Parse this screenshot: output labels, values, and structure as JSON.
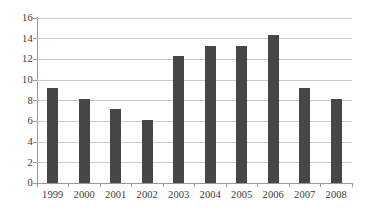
{
  "chart_data": {
    "type": "bar",
    "title": "",
    "subtitle": "",
    "xlabel": "",
    "ylabel": "",
    "categories": [
      "1999",
      "2000",
      "2001",
      "2002",
      "2003",
      "2004",
      "2005",
      "2006",
      "2007",
      "2008"
    ],
    "values": [
      9,
      8,
      7,
      6,
      12,
      13,
      13,
      14,
      9,
      8
    ],
    "series": [
      {
        "name": "",
        "values": [
          9,
          8,
          7,
          6,
          12,
          13,
          13,
          14,
          9,
          8
        ]
      }
    ],
    "ylim": [
      0,
      16
    ],
    "y_ticks": [
      0,
      2,
      4,
      6,
      8,
      10,
      12,
      14,
      16
    ],
    "y_tick_labels": [
      "0",
      "2",
      "4",
      "6",
      "8",
      "10",
      "12",
      "14",
      "16"
    ],
    "grid": true,
    "grid_axis": "y",
    "legend": false,
    "legend_position": "none",
    "colors": {
      "bar": "#474747",
      "grid": "#c9c9c9",
      "axis": "#9a9a9a",
      "text": "#3a3a3a",
      "background": "#ffffff"
    }
  }
}
